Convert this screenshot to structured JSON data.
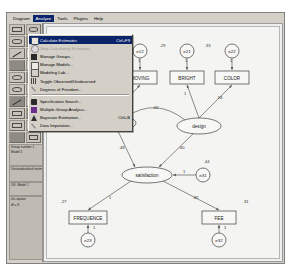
{
  "app": {
    "name": "Amos Graphics"
  },
  "menubar": {
    "items": [
      {
        "label": "Diagram",
        "open": false
      },
      {
        "label": "Analyze",
        "open": true
      },
      {
        "label": "Tools",
        "open": false
      },
      {
        "label": "Plugins",
        "open": false
      },
      {
        "label": "Help",
        "open": false
      }
    ]
  },
  "analyze_menu": {
    "items": [
      {
        "label": "Calculate Estimates",
        "accel": "Ctrl+F9",
        "icon": "abacus-icon",
        "selected": true,
        "disabled": false
      },
      {
        "label": "Stop Calculating Estimates",
        "accel": "",
        "icon": "stop-icon",
        "selected": false,
        "disabled": true
      },
      {
        "label": "Manage Groups...",
        "accel": "",
        "icon": "manage-groups-icon",
        "selected": false,
        "disabled": false
      },
      {
        "label": "Manage Models...",
        "accel": "",
        "icon": "manage-models-icon",
        "selected": false,
        "disabled": false
      },
      {
        "label": "Modeling Lab...",
        "accel": "",
        "icon": "flask-icon",
        "selected": false,
        "disabled": false
      },
      {
        "label": "Toggle Observed/Unobserved",
        "accel": "",
        "icon": "toggle-icon",
        "selected": false,
        "disabled": false
      },
      {
        "label": "Degrees of Freedom...",
        "accel": "",
        "icon": "degrees-icon",
        "selected": false,
        "disabled": false
      },
      {
        "sep": true
      },
      {
        "label": "Specification Search...",
        "accel": "",
        "icon": "binoculars-icon",
        "selected": false,
        "disabled": false
      },
      {
        "label": "Multiple-Group Analysis...",
        "accel": "",
        "icon": "multi-group-icon",
        "selected": false,
        "disabled": false
      },
      {
        "label": "Bayesian Estimation...",
        "accel": "Ctrl+B",
        "icon": "bayesian-icon",
        "selected": false,
        "disabled": false
      },
      {
        "label": "Data Imputation...",
        "accel": "",
        "icon": "imputation-icon",
        "selected": false,
        "disabled": false
      }
    ]
  },
  "toolbox": {
    "tools": [
      {
        "name": "rectangle-tool",
        "glyph": "rect"
      },
      {
        "name": "ellipse-tool",
        "glyph": "ell"
      },
      {
        "name": "latent-variable-tool",
        "glyph": "ellgrp"
      },
      {
        "name": "path-tool",
        "glyph": "line"
      },
      {
        "name": "covariance-tool",
        "glyph": "arc"
      },
      {
        "name": "unique-variable-tool",
        "glyph": "circ"
      },
      {
        "name": "title-tool",
        "glyph": "title"
      },
      {
        "name": "list-variables-tool",
        "glyph": "list"
      },
      {
        "name": "select-one-tool",
        "glyph": "hand"
      },
      {
        "name": "select-all-tool",
        "glyph": "handall"
      },
      {
        "name": "deselect-tool",
        "glyph": "handnone"
      },
      {
        "name": "duplicate-tool",
        "glyph": "copy"
      },
      {
        "name": "move-tool",
        "glyph": "move"
      },
      {
        "name": "erase-tool",
        "glyph": "erase"
      },
      {
        "name": "resize-tool",
        "glyph": "resize"
      },
      {
        "name": "touch-up-tool",
        "glyph": "touch"
      },
      {
        "name": "data-files-tool",
        "glyph": "files"
      },
      {
        "name": "analysis-properties-tool",
        "glyph": "props"
      },
      {
        "name": "calculate-tool",
        "glyph": "calc"
      },
      {
        "name": "copy-clipboard-tool",
        "glyph": "clip"
      },
      {
        "name": "text-output-tool",
        "glyph": "textout"
      },
      {
        "name": "save-tool",
        "glyph": "save"
      }
    ],
    "group_panel": {
      "line1": "Group number 1",
      "line2": "Model 1"
    },
    "model_panel": {
      "line1": "Unstandardized estimates"
    },
    "view_panel": {
      "line1": "OK: Model 1"
    },
    "output_panel": {
      "line1": "chi-square",
      "line2": "df = 8"
    }
  },
  "diagram": {
    "title": "",
    "observed": [
      {
        "id": "space",
        "label": "SPACE",
        "x": 32,
        "y": 44,
        "w": 34,
        "h": 13
      },
      {
        "id": "moving",
        "label": "MOVING",
        "x": 76,
        "y": 44,
        "w": 34,
        "h": 13
      },
      {
        "id": "bright",
        "label": "BRIGHT",
        "x": 123,
        "y": 44,
        "w": 34,
        "h": 13
      },
      {
        "id": "color",
        "label": "COLOR",
        "x": 168,
        "y": 44,
        "w": 34,
        "h": 13
      },
      {
        "id": "frequence",
        "label": "FREQUENCE",
        "x": 22,
        "y": 184,
        "w": 38,
        "h": 13
      },
      {
        "id": "fee",
        "label": "FEE",
        "x": 155,
        "y": 184,
        "w": 34,
        "h": 13
      }
    ],
    "latent": [
      {
        "id": "functional",
        "label": "functionel",
        "cx": 65,
        "cy": 96,
        "rx": 24,
        "ry": 8
      },
      {
        "id": "design",
        "label": "design",
        "cx": 152,
        "cy": 99,
        "rx": 22,
        "ry": 8
      },
      {
        "id": "satisfaction",
        "label": "satisfaction",
        "cx": 100,
        "cy": 148,
        "rx": 25,
        "ry": 8
      }
    ],
    "errors": [
      {
        "id": "e11",
        "label": "e11",
        "cx": 49,
        "cy": 24,
        "r": 7
      },
      {
        "id": "e12",
        "label": "e12",
        "cx": 93,
        "cy": 24,
        "r": 7
      },
      {
        "id": "e21",
        "label": "e21",
        "cx": 140,
        "cy": 24,
        "r": 7
      },
      {
        "id": "e22",
        "label": "e22",
        "cx": 185,
        "cy": 24,
        "r": 7
      },
      {
        "id": "e23",
        "label": "e23",
        "cx": 41,
        "cy": 213,
        "r": 7
      },
      {
        "id": "e32",
        "label": "e32",
        "cx": 172,
        "cy": 213,
        "r": 7
      },
      {
        "id": "e31",
        "label": "e31",
        "cx": 156,
        "cy": 148,
        "r": 7
      }
    ],
    "estimates": [
      {
        "text": "1",
        "x": 47,
        "y": 35
      },
      {
        "text": "1",
        "x": 91,
        "y": 35
      },
      {
        "text": "1",
        "x": 138,
        "y": 35
      },
      {
        "text": "1",
        "x": 183,
        "y": 35
      },
      {
        "text": ".36",
        "x": 22,
        "y": 20
      },
      {
        "text": ".41",
        "x": 66,
        "y": 20
      },
      {
        "text": ".29",
        "x": 113,
        "y": 20
      },
      {
        "text": ".33",
        "x": 158,
        "y": 20
      },
      {
        "text": "1",
        "x": 47,
        "y": 68
      },
      {
        "text": ".87",
        "x": 75,
        "y": 72
      },
      {
        "text": "1",
        "x": 137,
        "y": 68
      },
      {
        "text": ".94",
        "x": 170,
        "y": 72
      },
      {
        "text": ".62",
        "x": 106,
        "y": 82
      },
      {
        "text": ".48",
        "x": 72,
        "y": 122
      },
      {
        "text": ".60",
        "x": 132,
        "y": 122
      },
      {
        "text": "1",
        "x": 136,
        "y": 146
      },
      {
        "text": ".44",
        "x": 157,
        "y": 136
      },
      {
        "text": "1",
        "x": 62,
        "y": 172
      },
      {
        "text": ".82",
        "x": 146,
        "y": 172
      },
      {
        "text": "1",
        "x": 46,
        "y": 202
      },
      {
        "text": "1",
        "x": 177,
        "y": 202
      },
      {
        "text": ".27",
        "x": 14,
        "y": 176
      },
      {
        "text": ".31",
        "x": 196,
        "y": 176
      }
    ]
  }
}
